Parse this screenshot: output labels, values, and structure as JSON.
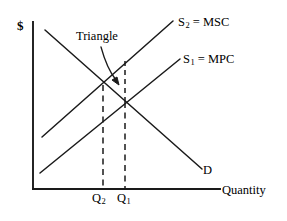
{
  "figure": {
    "type": "economics-supply-demand-diagram",
    "background_color": "#ffffff",
    "line_color": "#1a1a1a"
  },
  "axes": {
    "y_axis_label": "$",
    "x_axis_label": "Quantity",
    "origin": {
      "x": 33,
      "y": 189
    },
    "x_axis_end": {
      "x": 220,
      "y": 189
    },
    "y_axis_top": {
      "x": 33,
      "y": 22
    }
  },
  "curves": [
    {
      "id": "demand",
      "label": "D",
      "style": "solid",
      "start": {
        "x": 45,
        "y": 30
      },
      "end": {
        "x": 202,
        "y": 169
      }
    },
    {
      "id": "supply-social",
      "label": "S",
      "subscript": "2",
      "label_full": "S2 = MSC",
      "equals_text": "= MSC",
      "style": "solid",
      "start": {
        "x": 42,
        "y": 137
      },
      "end": {
        "x": 173,
        "y": 21
      }
    },
    {
      "id": "supply-private",
      "label": "S",
      "subscript": "1",
      "label_full": "S1 = MPC",
      "equals_text": "= MPC",
      "style": "solid",
      "start": {
        "x": 40,
        "y": 173
      },
      "end": {
        "x": 180,
        "y": 59
      }
    }
  ],
  "annotations": {
    "triangle_label": "Triangle",
    "arrow": {
      "from": {
        "x": 101,
        "y": 48
      },
      "to": {
        "x": 118,
        "y": 84
      },
      "style": "curved-with-arrowhead"
    },
    "deadweight_triangle": {
      "vertices": [
        {
          "x": 103,
          "y": 86
        },
        {
          "x": 125,
          "y": 62
        },
        {
          "x": 125,
          "y": 103
        }
      ],
      "right_edge_style": "dashed"
    }
  },
  "equilibria": [
    {
      "id": "q2-socially-optimal",
      "tick_label": "Q",
      "subscript": "2",
      "label_full": "Q2",
      "x": 103,
      "y": 86,
      "dropline_style": "dashed"
    },
    {
      "id": "q1-market",
      "tick_label": "Q",
      "subscript": "1",
      "label_full": "Q1",
      "x": 125,
      "y": 103,
      "dropline_style": "dashed"
    }
  ]
}
